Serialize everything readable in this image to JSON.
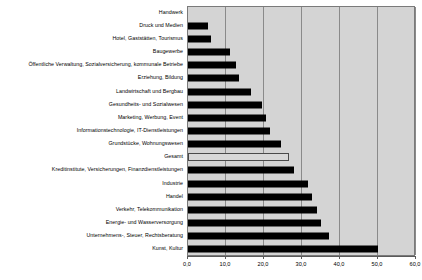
{
  "chart_data": {
    "type": "bar",
    "orientation": "horizontal",
    "title": "",
    "xlabel": "",
    "ylabel": "",
    "xlim": [
      0,
      60
    ],
    "xtick_labels": [
      "0,0",
      "10,0",
      "20,0",
      "30,0",
      "40,0",
      "50,0",
      "60,0"
    ],
    "xticks": [
      0,
      10,
      20,
      30,
      40,
      50,
      60
    ],
    "grid": true,
    "legend": "none",
    "highlight_category": "Gesamt",
    "categories": [
      "Handwerk",
      "Druck und Medien",
      "Hotel, Gaststätten, Tourismus",
      "Baugewerbe",
      "Öffentliche Verwaltung, Sozialversicherung, kommunale Betriebe",
      "Erziehung, Bildung",
      "Landwirtschaft und Bergbau",
      "Gesundheits- und Sozialwesen",
      "Marketing, Werbung, Event",
      "Informationstechnologie, IT-Dienstleistungen",
      "Grundstücke, Wohnungswesen",
      "Gesamt",
      "Kreditinstitute, Versicherungen, Finanzdienstleistungen",
      "Industrie",
      "Handel",
      "Verkehr, Telekommunikation",
      "Energie- und Wasserversorgung",
      "Unternehmens-, Steuer, Rechtsberatung",
      "Kunst, Kultur"
    ],
    "values": [
      0.0,
      5.3,
      6.0,
      11.0,
      12.5,
      13.5,
      16.5,
      19.5,
      20.5,
      21.5,
      24.5,
      26.5,
      28.0,
      31.5,
      32.5,
      34.0,
      35.0,
      37.0,
      50.0
    ],
    "colors": {
      "bar": "#000000",
      "total_bar": "#d8d8d8",
      "plot_background": "#d4d4d4",
      "gridline": "#8a8a8a",
      "axis": "#5a5a5a",
      "text": "#000000"
    }
  }
}
